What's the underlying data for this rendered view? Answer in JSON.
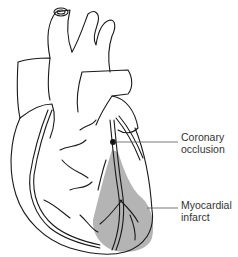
{
  "figure": {
    "labels": {
      "occlusion": [
        "Coronary",
        "occlusion"
      ],
      "infarct": [
        "Myocardial",
        "infarct"
      ]
    },
    "colors": {
      "line": "#1a1a1a",
      "infarct_fill": "#b4b4b4",
      "leader": "#555555",
      "background": "#ffffff"
    }
  }
}
